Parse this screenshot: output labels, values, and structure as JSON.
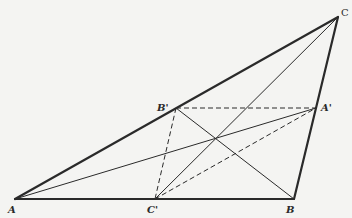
{
  "diagram": {
    "type": "geometry",
    "colors": {
      "background": "#f4f4f2",
      "stroke": "#2a2a2a"
    },
    "points": {
      "A": {
        "label": "A",
        "x": 15,
        "y": 199
      },
      "B": {
        "label": "B",
        "x": 294,
        "y": 199
      },
      "C": {
        "label": "C",
        "x": 338,
        "y": 17
      },
      "A_prime": {
        "label": "A'",
        "x": 316,
        "y": 108
      },
      "B_prime": {
        "label": "B'",
        "x": 176,
        "y": 108
      },
      "C_prime": {
        "label": "C'",
        "x": 155,
        "y": 199
      }
    },
    "labels": {
      "A": "A",
      "B": "B",
      "C": "C",
      "A_prime": "A'",
      "B_prime": "B'",
      "C_prime": "C'"
    }
  }
}
